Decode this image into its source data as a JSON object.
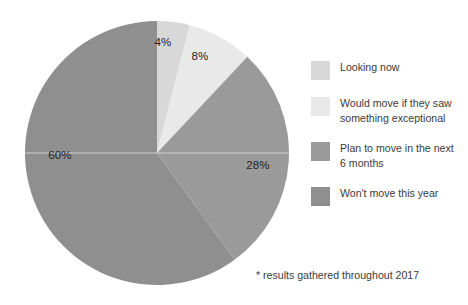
{
  "chart_data": {
    "type": "pie",
    "title": "",
    "subtitle": "",
    "xlabel": "",
    "ylabel": "",
    "legend_position": "right",
    "grid": false,
    "start_angle_deg": 0,
    "direction": "clockwise",
    "center": {
      "x": 157,
      "y": 153
    },
    "radius": 132,
    "total": 100,
    "units": "%",
    "categories": [
      "Looking now",
      "Would move if they saw something exceptional",
      "Plan to move in the next 6 months",
      "Won't move this year"
    ],
    "values": [
      4,
      8,
      28,
      60
    ],
    "labels": [
      "4%",
      "8%",
      "28%",
      "60%"
    ],
    "colors": [
      "#d8d8d8",
      "#e9e9e9",
      "#9a9a9a",
      "#8f8f8f"
    ],
    "slices": [
      {
        "label": "4%",
        "value": 4,
        "category": "Looking now",
        "color": "#d8d8d8",
        "start_deg": 0,
        "end_deg": 14.4,
        "label_x": 163,
        "label_y": 42
      },
      {
        "label": "8%",
        "value": 8,
        "category": "Would move if they saw something exceptional",
        "color": "#e9e9e9",
        "start_deg": 14.4,
        "end_deg": 43.2,
        "label_x": 200,
        "label_y": 56
      },
      {
        "label": "28%",
        "value": 28,
        "category": "Plan to move in the next 6 months",
        "color": "#9a9a9a",
        "start_deg": 43.2,
        "end_deg": 144.0,
        "label_x": 258,
        "label_y": 165
      },
      {
        "label": "60%",
        "value": 60,
        "category": "Won't move this year",
        "color": "#8f8f8f",
        "start_deg": 144.0,
        "end_deg": 360.0,
        "label_x": 60,
        "label_y": 155
      }
    ],
    "annotations": [
      "* results gathered throughout 2017"
    ]
  },
  "legend": {
    "items": [
      {
        "label": "Looking now",
        "color": "#d8d8d8"
      },
      {
        "label": "Would move if they saw\nsomething exceptional",
        "color": "#e9e9e9"
      },
      {
        "label": "Plan to move in the next\n6 months",
        "color": "#9a9a9a"
      },
      {
        "label": "Won't move this year",
        "color": "#8f8f8f"
      }
    ]
  },
  "footnote": {
    "text": "* results gathered throughout 2017"
  },
  "style": {
    "background": "#ffffff",
    "text_color": "#231f20",
    "muted_text_color": "#3b3b3d",
    "divider_color": "#cfcfcf"
  }
}
